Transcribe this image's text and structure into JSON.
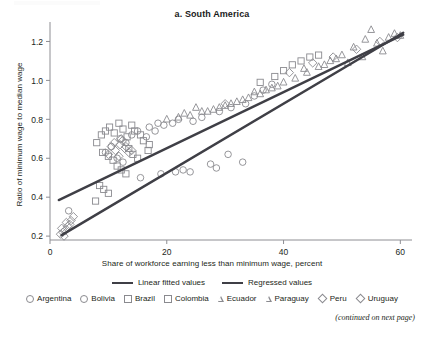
{
  "figure": {
    "title": "a. South America",
    "continued_note": "(continued on next page)"
  },
  "axes": {
    "x_title": "Share of workforce earning less than minimum wage, percent",
    "y_title": "Ratio of minimum wage to median wage"
  },
  "legend": {
    "lines": [
      {
        "label": "Linear fitted values",
        "color": "#3f3f46"
      },
      {
        "label": "Regressed values",
        "color": "#3f3f46"
      }
    ],
    "markers": [
      {
        "label": "Argentina",
        "shape": "circle"
      },
      {
        "label": "Bolivia",
        "shape": "circle"
      },
      {
        "label": "Brazil",
        "shape": "square"
      },
      {
        "label": "Colombia",
        "shape": "square"
      },
      {
        "label": "Ecuador",
        "shape": "triangle"
      },
      {
        "label": "Paraguay",
        "shape": "triangle"
      },
      {
        "label": "Peru",
        "shape": "diamond"
      },
      {
        "label": "Uruguay",
        "shape": "diamond"
      }
    ]
  },
  "chart_data": {
    "type": "scatter",
    "title": "a. South America",
    "xlabel": "Share of workforce earning less than minimum wage, percent",
    "ylabel": "Ratio of minimum wage to median wage",
    "xlim": [
      0,
      62
    ],
    "ylim": [
      0.18,
      1.3
    ],
    "xticks": [
      0,
      20,
      40,
      60
    ],
    "yticks": [
      0.2,
      0.4,
      0.6,
      0.8,
      1.0,
      1.2
    ],
    "xtick_labels": [
      "0",
      "20",
      "40",
      "60"
    ],
    "ytick_labels": [
      "0.2",
      "0.4",
      "0.6",
      "0.8",
      "1.0",
      "1.2"
    ],
    "grid": false,
    "legend_position": "below",
    "marker_color": "#8a8a8f",
    "line_color": "#3f3f46",
    "series": [
      {
        "name": "Argentina",
        "shape": "circle",
        "points": [
          [
            3.2,
            0.33
          ],
          [
            15.5,
            0.5
          ],
          [
            19.0,
            0.52
          ],
          [
            21.5,
            0.53
          ],
          [
            22.8,
            0.54
          ],
          [
            24.0,
            0.53
          ],
          [
            27.5,
            0.57
          ],
          [
            28.5,
            0.55
          ],
          [
            30.5,
            0.62
          ],
          [
            33.0,
            0.58
          ],
          [
            24.5,
            0.79
          ],
          [
            26.0,
            0.81
          ],
          [
            21.0,
            0.78
          ],
          [
            22.0,
            0.8
          ],
          [
            19.5,
            0.77
          ],
          [
            29.0,
            0.84
          ],
          [
            31.0,
            0.86
          ],
          [
            33.5,
            0.88
          ]
        ]
      },
      {
        "name": "Bolivia",
        "shape": "circle",
        "points": [
          [
            9.5,
            0.63
          ],
          [
            10.5,
            0.66
          ],
          [
            12.0,
            0.7
          ],
          [
            13.0,
            0.68
          ],
          [
            14.0,
            0.72
          ],
          [
            15.0,
            0.74
          ],
          [
            16.5,
            0.71
          ],
          [
            18.0,
            0.74
          ],
          [
            11.5,
            0.6
          ],
          [
            12.5,
            0.58
          ],
          [
            17.0,
            0.76
          ],
          [
            18.5,
            0.78
          ],
          [
            35.0,
            0.92
          ],
          [
            36.5,
            0.95
          ],
          [
            38.0,
            0.98
          ]
        ]
      },
      {
        "name": "Brazil",
        "shape": "square",
        "points": [
          [
            8.0,
            0.68
          ],
          [
            8.8,
            0.72
          ],
          [
            9.5,
            0.74
          ],
          [
            10.2,
            0.76
          ],
          [
            11.0,
            0.73
          ],
          [
            11.8,
            0.78
          ],
          [
            12.5,
            0.75
          ],
          [
            13.2,
            0.71
          ],
          [
            14.0,
            0.77
          ],
          [
            9.0,
            0.63
          ],
          [
            10.0,
            0.61
          ],
          [
            10.8,
            0.59
          ],
          [
            11.5,
            0.56
          ],
          [
            12.2,
            0.54
          ],
          [
            13.0,
            0.52
          ],
          [
            8.5,
            0.46
          ],
          [
            9.2,
            0.44
          ],
          [
            10.0,
            0.42
          ],
          [
            7.8,
            0.38
          ]
        ]
      },
      {
        "name": "Colombia",
        "shape": "square",
        "points": [
          [
            14.5,
            0.74
          ],
          [
            15.5,
            0.72
          ],
          [
            16.0,
            0.69
          ],
          [
            17.0,
            0.67
          ],
          [
            13.5,
            0.65
          ],
          [
            14.2,
            0.62
          ],
          [
            15.0,
            0.6
          ],
          [
            16.8,
            0.64
          ],
          [
            38.5,
            1.02
          ],
          [
            40.0,
            1.05
          ],
          [
            41.5,
            1.08
          ],
          [
            43.0,
            1.1
          ],
          [
            44.5,
            1.12
          ],
          [
            46.0,
            1.13
          ],
          [
            36.0,
            0.99
          ]
        ]
      },
      {
        "name": "Ecuador",
        "shape": "triangle",
        "points": [
          [
            24.0,
            0.82
          ],
          [
            26.0,
            0.84
          ],
          [
            28.0,
            0.85
          ],
          [
            30.0,
            0.87
          ],
          [
            32.0,
            0.89
          ],
          [
            34.0,
            0.91
          ],
          [
            36.0,
            0.93
          ],
          [
            38.0,
            0.96
          ],
          [
            40.0,
            0.99
          ],
          [
            42.0,
            1.01
          ],
          [
            44.0,
            1.04
          ],
          [
            46.0,
            1.07
          ],
          [
            48.0,
            1.1
          ],
          [
            50.0,
            1.13
          ],
          [
            52.0,
            1.17
          ],
          [
            54.0,
            1.21
          ],
          [
            56.0,
            1.19
          ],
          [
            58.0,
            1.22
          ],
          [
            60.0,
            1.23
          ],
          [
            51.0,
            1.09
          ],
          [
            53.5,
            1.12
          ],
          [
            57.0,
            1.15
          ]
        ]
      },
      {
        "name": "Paraguay",
        "shape": "triangle",
        "points": [
          [
            20.0,
            0.8
          ],
          [
            22.0,
            0.81
          ],
          [
            23.0,
            0.83
          ],
          [
            25.0,
            0.86
          ],
          [
            27.0,
            0.84
          ],
          [
            29.0,
            0.86
          ],
          [
            31.0,
            0.88
          ],
          [
            33.0,
            0.9
          ],
          [
            35.0,
            0.94
          ],
          [
            37.0,
            0.95
          ],
          [
            39.0,
            0.97
          ],
          [
            43.5,
            1.06
          ],
          [
            47.0,
            1.08
          ],
          [
            49.0,
            1.11
          ],
          [
            55.0,
            1.26
          ],
          [
            59.0,
            1.24
          ]
        ]
      },
      {
        "name": "Peru",
        "shape": "diamond",
        "points": [
          [
            1.8,
            0.21
          ],
          [
            2.2,
            0.22
          ],
          [
            2.6,
            0.23
          ],
          [
            3.0,
            0.25
          ],
          [
            3.4,
            0.26
          ],
          [
            2.0,
            0.24
          ],
          [
            2.8,
            0.27
          ],
          [
            10.5,
            0.66
          ],
          [
            11.2,
            0.64
          ],
          [
            12.0,
            0.67
          ],
          [
            12.8,
            0.65
          ],
          [
            13.5,
            0.63
          ],
          [
            11.8,
            0.61
          ],
          [
            12.4,
            0.69
          ]
        ]
      },
      {
        "name": "Uruguay",
        "shape": "diamond",
        "points": [
          [
            2.4,
            0.2
          ],
          [
            3.6,
            0.28
          ],
          [
            4.0,
            0.3
          ],
          [
            10.0,
            0.62
          ],
          [
            11.0,
            0.68
          ],
          [
            12.2,
            0.7
          ],
          [
            13.0,
            0.66
          ],
          [
            14.0,
            0.64
          ],
          [
            41.0,
            1.04
          ],
          [
            45.0,
            1.09
          ],
          [
            48.5,
            1.12
          ],
          [
            52.5,
            1.16
          ],
          [
            56.5,
            1.2
          ],
          [
            59.5,
            1.22
          ],
          [
            30.0,
            0.88
          ]
        ]
      }
    ],
    "lines": [
      {
        "name": "Linear fitted values",
        "x": [
          1.5,
          60.5
        ],
        "y": [
          0.385,
          1.235
        ],
        "color": "#3f3f46",
        "width": 2.4
      },
      {
        "name": "Regressed values",
        "x": [
          2.0,
          60.5
        ],
        "y": [
          0.205,
          1.245
        ],
        "color": "#3f3f46",
        "width": 2.4
      }
    ]
  }
}
